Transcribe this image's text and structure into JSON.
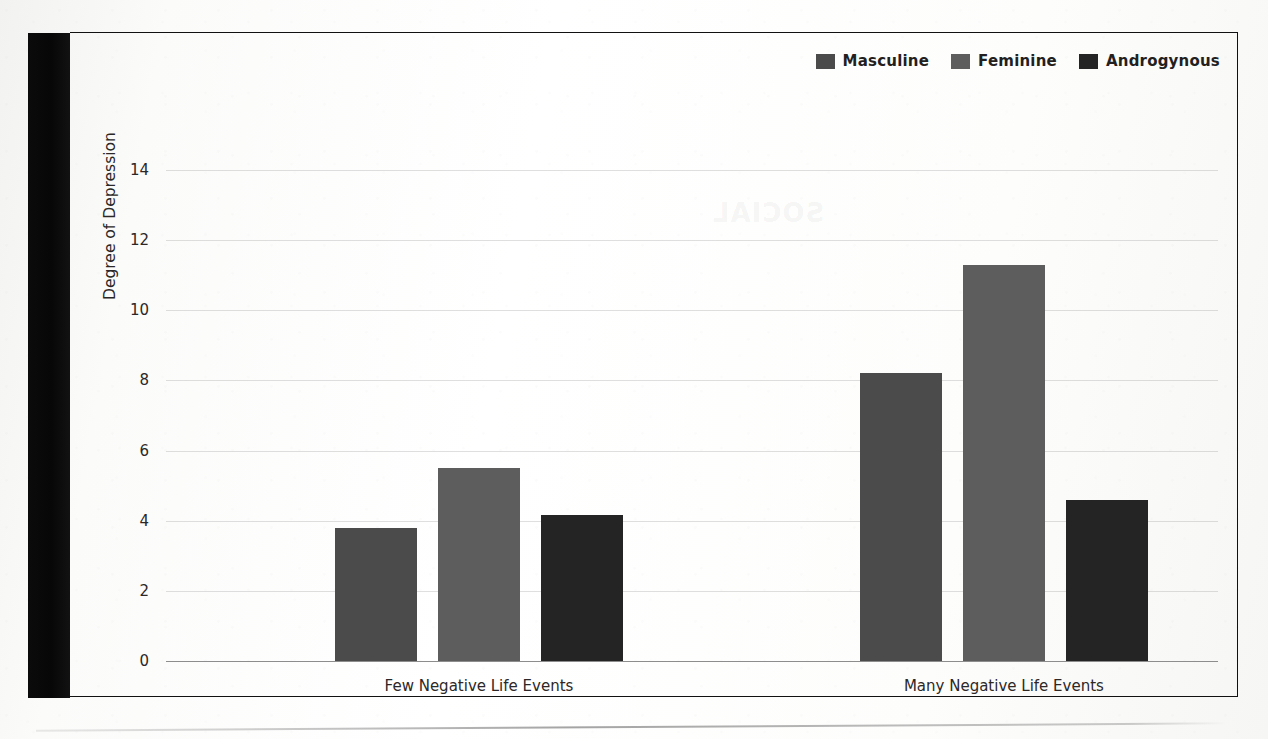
{
  "chart_data": {
    "type": "bar",
    "title": "",
    "xlabel": "",
    "ylabel": "Degree of Depression",
    "ylim": [
      0,
      15
    ],
    "yticks": [
      0,
      2,
      4,
      6,
      8,
      10,
      12,
      14
    ],
    "grid": true,
    "legend_position": "top-right",
    "categories": [
      "Few Negative Life Events",
      "Many Negative Life Events"
    ],
    "series": [
      {
        "name": "Masculine",
        "color": "#4b4b4b",
        "values": [
          3.8,
          8.2
        ]
      },
      {
        "name": "Feminine",
        "color": "#5d5d5d",
        "values": [
          5.5,
          11.3
        ]
      },
      {
        "name": "Androgynous",
        "color": "#242424",
        "values": [
          4.15,
          4.6
        ]
      }
    ]
  },
  "ghost_text": {
    "line1": "SOCIAL",
    "line2": "reversed bleed-through"
  }
}
